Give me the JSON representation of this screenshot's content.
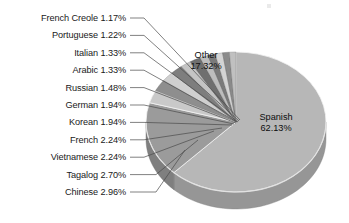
{
  "chart_data": {
    "type": "pie",
    "title": "",
    "subtitle": "",
    "xlabel": "",
    "ylabel": "",
    "legend_position": "none",
    "grid": false,
    "units": "percent",
    "three_d": true,
    "start_angle_deg": 0,
    "direction": "clockwise",
    "categories": [
      "Spanish",
      "Other",
      "Chinese",
      "Tagalog",
      "Vietnamese",
      "French",
      "Korean",
      "German",
      "Russian",
      "Arabic",
      "Italian",
      "Portuguese",
      "French Creole"
    ],
    "values": [
      62.13,
      17.32,
      2.96,
      2.7,
      2.24,
      2.24,
      1.94,
      1.94,
      1.48,
      1.33,
      1.33,
      1.22,
      1.17
    ],
    "slices": [
      {
        "label": "Spanish",
        "value": 62.13,
        "text": "Spanish 62.13%",
        "pct_text": "62.13%",
        "placement": "inside",
        "color": "#b7b7b7"
      },
      {
        "label": "Other",
        "value": 17.32,
        "text": "Other 17.32%",
        "pct_text": "17.32%",
        "placement": "inside",
        "color": "#9b9b9b"
      },
      {
        "label": "Chinese",
        "value": 2.96,
        "text": "Chinese 2.96%",
        "pct_text": "2.96%",
        "placement": "leader",
        "color": "#c9c9c9"
      },
      {
        "label": "Tagalog",
        "value": 2.7,
        "text": "Tagalog 2.70%",
        "pct_text": "2.70%",
        "placement": "leader",
        "color": "#8e8e8e"
      },
      {
        "label": "Vietnamese",
        "value": 2.24,
        "text": "Vietnamese 2.24%",
        "pct_text": "2.24%",
        "placement": "leader",
        "color": "#cfcfcf"
      },
      {
        "label": "French",
        "value": 2.24,
        "text": "French 2.24%",
        "pct_text": "2.24%",
        "placement": "leader",
        "color": "#7e7e7e"
      },
      {
        "label": "Korean",
        "value": 1.94,
        "text": "Korean 1.94%",
        "pct_text": "1.94%",
        "placement": "leader",
        "color": "#c4c4c4"
      },
      {
        "label": "German",
        "value": 1.94,
        "text": "German 1.94%",
        "pct_text": "1.94%",
        "placement": "leader",
        "color": "#6f6f6f"
      },
      {
        "label": "Russian",
        "value": 1.48,
        "text": "Russian 1.48%",
        "pct_text": "1.48%",
        "placement": "leader",
        "color": "#bdbdbd"
      },
      {
        "label": "Arabic",
        "value": 1.33,
        "text": "Arabic 1.33%",
        "pct_text": "1.33%",
        "placement": "leader",
        "color": "#7a7a7a"
      },
      {
        "label": "Italian",
        "value": 1.33,
        "text": "Italian 1.33%",
        "pct_text": "1.33%",
        "placement": "leader",
        "color": "#d4d4d4"
      },
      {
        "label": "Portuguese",
        "value": 1.22,
        "text": "Portuguese 1.22%",
        "pct_text": "1.22%",
        "placement": "leader",
        "color": "#8a8a8a"
      },
      {
        "label": "French Creole",
        "value": 1.17,
        "text": "French Creole 1.17%",
        "pct_text": "1.17%",
        "placement": "leader",
        "color": "#c0c0c0"
      }
    ],
    "colors": {
      "background": "#ffffff",
      "text": "#1a1a1a",
      "leader_line": "#4a4a4a",
      "spanish_fill": "#b7b7b7",
      "other_fill": "#9b9b9b",
      "side_wall": "#9e9e9e",
      "rim_highlight": "#e2e2e2"
    }
  },
  "labels": {
    "inside": [
      {
        "name": "Other",
        "line1": "Other",
        "line2": "17.32%"
      },
      {
        "name": "Spanish",
        "line1": "Spanish",
        "line2": "62.13%"
      }
    ],
    "left_column": [
      {
        "text": "French Creole 1.17%"
      },
      {
        "text": "Portuguese 1.22%"
      },
      {
        "text": "Italian 1.33%"
      },
      {
        "text": "Arabic 1.33%"
      },
      {
        "text": "Russian 1.48%"
      },
      {
        "text": "German 1.94%"
      },
      {
        "text": "Korean 1.94%"
      },
      {
        "text": "French 2.24%"
      },
      {
        "text": "Vietnamese 2.24%"
      },
      {
        "text": "Tagalog 2.70%"
      },
      {
        "text": "Chinese 2.96%"
      }
    ]
  }
}
